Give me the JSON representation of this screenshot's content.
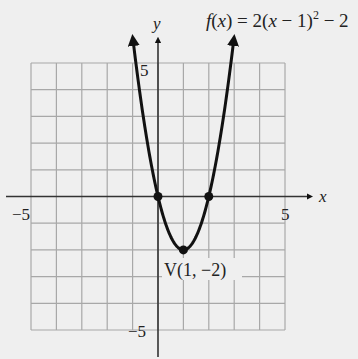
{
  "chart_data": {
    "type": "line",
    "function": "f(x) = 2(x - 1)^2 - 2",
    "xlabel": "x",
    "ylabel": "y",
    "xlim": [
      -5,
      5
    ],
    "ylim": [
      -5,
      5
    ],
    "grid": true,
    "grid_step": 1,
    "tick_labels": {
      "x_min": "−5",
      "x_max": "5",
      "y_max": "5",
      "y_min": "−5"
    },
    "series": [
      {
        "name": "f(x) = 2(x − 1)² − 2",
        "x": [
          -1,
          -0.5,
          0,
          0.5,
          1,
          1.5,
          2,
          2.5,
          3
        ],
        "y": [
          6,
          2.5,
          0,
          -1.5,
          -2,
          -1.5,
          0,
          2.5,
          6
        ]
      }
    ],
    "points": [
      {
        "x": 0,
        "y": 0,
        "label": ""
      },
      {
        "x": 2,
        "y": 0,
        "label": ""
      },
      {
        "x": 1,
        "y": -2,
        "label": "V(1, −2)"
      }
    ],
    "annotations": [
      "V(1, −2)"
    ]
  },
  "labels": {
    "title_f": "f",
    "title_rest_1": "(",
    "title_x1": "x",
    "title_rest_2": ") = 2(",
    "title_x2": "x",
    "title_rest_3": " − 1)",
    "title_exp": "2",
    "title_rest_4": " − 2",
    "x_axis": "x",
    "y_axis": "y",
    "x_min": "−5",
    "x_max": "5",
    "y_max": "5",
    "y_min": "−5",
    "vertex": "V(1, −2)"
  },
  "colors": {
    "background": "#efefef",
    "grid": "#a8a8a8",
    "axis": "#333333",
    "curve": "#111111"
  }
}
